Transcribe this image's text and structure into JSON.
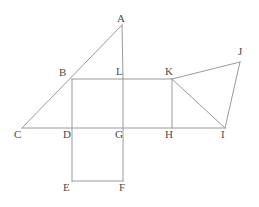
{
  "figure": {
    "kind": "geometry-diagram",
    "width": 259,
    "height": 207,
    "background_color": "#ffffff",
    "stroke_color": "#9a9a9a",
    "label_color": "#4a4a4a",
    "stroke_width": 1
  },
  "points": {
    "A": {
      "label": "A",
      "x": 122,
      "y": 25,
      "label_x": 117,
      "label_y": 13
    },
    "B": {
      "label": "B",
      "x": 72,
      "y": 79,
      "label_x": 59,
      "label_y": 67
    },
    "C": {
      "label": "C",
      "x": 22,
      "y": 128,
      "label_x": 14,
      "label_y": 129
    },
    "D": {
      "label": "D",
      "x": 72,
      "y": 128,
      "label_x": 63,
      "label_y": 129
    },
    "E": {
      "label": "E",
      "x": 72,
      "y": 181,
      "label_x": 63,
      "label_y": 182
    },
    "F": {
      "label": "F",
      "x": 123,
      "y": 181,
      "label_x": 119,
      "label_y": 182
    },
    "G": {
      "label": "G",
      "x": 123,
      "y": 128,
      "label_x": 115,
      "label_y": 129
    },
    "H": {
      "label": "H",
      "x": 172,
      "y": 128,
      "label_x": 165,
      "label_y": 129
    },
    "I": {
      "label": "I",
      "x": 225,
      "y": 128,
      "label_x": 221,
      "label_y": 129
    },
    "J": {
      "label": "J",
      "x": 240,
      "y": 62,
      "label_x": 238,
      "label_y": 46
    },
    "K": {
      "label": "K",
      "x": 172,
      "y": 79,
      "label_x": 165,
      "label_y": 66
    },
    "L": {
      "label": "L",
      "x": 123,
      "y": 79,
      "label_x": 116,
      "label_y": 66
    }
  },
  "segments": [
    {
      "name": "segment-C-A",
      "from": "C",
      "to": "A"
    },
    {
      "name": "segment-A-L",
      "from": "A",
      "to": "L"
    },
    {
      "name": "segment-C-I",
      "from": "C",
      "to": "I"
    },
    {
      "name": "segment-B-K",
      "from": "B",
      "to": "K"
    },
    {
      "name": "segment-B-E",
      "from": "B",
      "to": "E"
    },
    {
      "name": "segment-L-F",
      "from": "L",
      "to": "F"
    },
    {
      "name": "segment-E-F",
      "from": "E",
      "to": "F"
    },
    {
      "name": "segment-K-H",
      "from": "K",
      "to": "H"
    },
    {
      "name": "segment-K-I",
      "from": "K",
      "to": "I"
    },
    {
      "name": "segment-K-J",
      "from": "K",
      "to": "J"
    },
    {
      "name": "segment-J-I",
      "from": "J",
      "to": "I"
    }
  ]
}
